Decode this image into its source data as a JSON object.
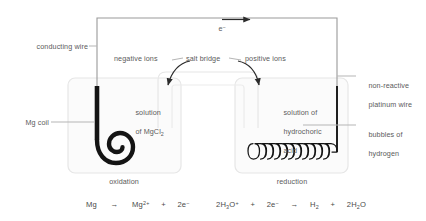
{
  "diagram": {
    "colors": {
      "wire_dark": "#1a1a1a",
      "wire_light": "#9a9a9a",
      "beaker_fill": "#fbfbfb",
      "beaker_stroke": "#e3e3e3",
      "salt_bridge_stroke": "#e3e3e3",
      "leader_line": "#b5b5b5",
      "text": "#5b5b5b",
      "arrow": "#2b2b2b"
    }
  },
  "labels": {
    "conducting_wire": "conducting wire",
    "mg_coil": "Mg coil",
    "negative_ions": "negative ions",
    "salt_bridge": "salt bridge",
    "positive_ions": "positive ions",
    "electron": "e",
    "electron_charge": "−",
    "solution_left_line1": "solution",
    "solution_left_line2": "of MgCl",
    "solution_left_sub": "2",
    "solution_right_line1": "solution of",
    "solution_right_line2": "hydrochoric",
    "solution_right_line3": "acid",
    "non_reactive_line1": "non-reactive",
    "non_reactive_line2": "platinum wire",
    "bubbles_line1": "bubbles of",
    "bubbles_line2": "hydrogen",
    "oxidation": "oxidation",
    "reduction": "reduction"
  },
  "equations": {
    "oxidation": {
      "reactant": "Mg",
      "arrow": "→",
      "product1_base": "Mg",
      "product1_charge": "2+",
      "plus": "+",
      "product2_base": "2e",
      "product2_charge": "−"
    },
    "reduction": {
      "r1_coeff": "2H",
      "r1_sub": "3",
      "r1_elem": "O",
      "r1_charge": "+",
      "plus1": "+",
      "r2_base": "2e",
      "r2_charge": "−",
      "arrow": "→",
      "p1_base": "H",
      "p1_sub": "2",
      "plus2": "+",
      "p2_coeff": "2H",
      "p2_sub": "2",
      "p2_elem": "O"
    }
  }
}
